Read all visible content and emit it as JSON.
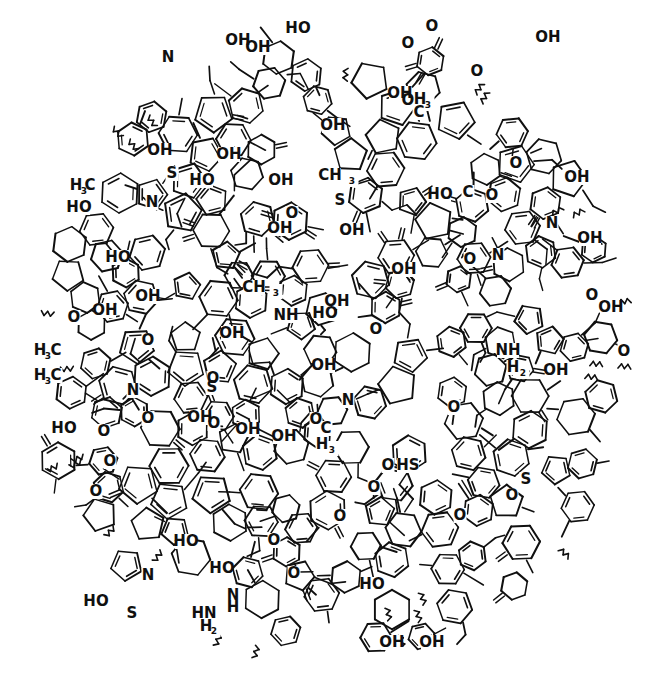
{
  "figure": {
    "kind": "chemical-structure-diagram",
    "background_color": "#ffffff",
    "ink_color": "#101010",
    "width": 661,
    "height": 675,
    "line_style": "black skeletal bond lines, variable weight, scanned print",
    "top_edge_artifact": "partial cropped ink marks from the line of text above the figure"
  },
  "chart_data": {
    "type": "diagram",
    "xlabel": "",
    "ylabel": "",
    "ring_systems": [
      "benzene",
      "naphthalene",
      "anthracene",
      "phenanthrene",
      "fluorene",
      "indane",
      "cyclopentane",
      "cyclohexane",
      "tetrahydropyran",
      "benzofuran",
      "dibenzofuran",
      "furan",
      "chromene",
      "chroman",
      "thiophene",
      "benzothiophene",
      "dibenzothiophene",
      "pyridine",
      "quinoline",
      "acridine",
      "indole",
      "carbazole",
      "quinone",
      "benzodioxine",
      "xanthene"
    ],
    "functional_groups": [
      "hydroxyl (OH)",
      "phenol (HO)",
      "ether (O)",
      "ketone (=O)",
      "carboxylic acid (HOOC)",
      "thiol (HS)",
      "thioether (S)",
      "amine (NH2)",
      "secondary amine (NH / HN)",
      "ring nitrogen (N)",
      "methyl (CH3 / H3C)"
    ],
    "label_counts": {
      "OH": 34,
      "HO": 14,
      "O": 22,
      "N": 8,
      "NH": 3,
      "NH2": 1,
      "HN": 2,
      "S": 4,
      "HS": 1,
      "CH3": 3,
      "H3C": 5,
      "HOOC": 1
    }
  },
  "labels": [
    {
      "t": "N",
      "x": 168,
      "y": 62
    },
    {
      "t": "OH",
      "x": 238,
      "y": 45
    },
    {
      "t": "OH",
      "x": 258,
      "y": 52
    },
    {
      "t": "HO",
      "x": 298,
      "y": 33
    },
    {
      "t": "O",
      "x": 432,
      "y": 31
    },
    {
      "t": "O",
      "x": 408,
      "y": 48
    },
    {
      "t": "O",
      "x": 408,
      "y": 105
    },
    {
      "t": "OH",
      "x": 548,
      "y": 42
    },
    {
      "t": "O",
      "x": 477,
      "y": 76
    },
    {
      "t": "OH",
      "x": 400,
      "y": 98
    },
    {
      "t": "H",
      "x": 420,
      "y": 104
    },
    {
      "t": "3",
      "x": 428,
      "y": 108
    },
    {
      "t": "C",
      "x": 419,
      "y": 117
    },
    {
      "t": "OH",
      "x": 333,
      "y": 130
    },
    {
      "t": "S",
      "x": 172,
      "y": 178
    },
    {
      "t": "H",
      "x": 76,
      "y": 190
    },
    {
      "t": "3",
      "x": 84,
      "y": 194
    },
    {
      "t": "C",
      "x": 90,
      "y": 190
    },
    {
      "t": "HO",
      "x": 79,
      "y": 212
    },
    {
      "t": "N",
      "x": 152,
      "y": 207
    },
    {
      "t": "OH",
      "x": 160,
      "y": 155
    },
    {
      "t": "OH",
      "x": 229,
      "y": 159
    },
    {
      "t": "HO",
      "x": 202,
      "y": 185
    },
    {
      "t": "OH",
      "x": 281,
      "y": 185
    },
    {
      "t": "CH",
      "x": 330,
      "y": 180
    },
    {
      "t": "3",
      "x": 352,
      "y": 184
    },
    {
      "t": "S",
      "x": 340,
      "y": 205
    },
    {
      "t": "O",
      "x": 292,
      "y": 218
    },
    {
      "t": "HO",
      "x": 440,
      "y": 199
    },
    {
      "t": "C",
      "x": 468,
      "y": 197
    },
    {
      "t": "O",
      "x": 492,
      "y": 200
    },
    {
      "t": "OH",
      "x": 577,
      "y": 182
    },
    {
      "t": "O",
      "x": 516,
      "y": 168
    },
    {
      "t": "N",
      "x": 552,
      "y": 228
    },
    {
      "t": "OH",
      "x": 590,
      "y": 243
    },
    {
      "t": "HO",
      "x": 118,
      "y": 262
    },
    {
      "t": "OH",
      "x": 280,
      "y": 233
    },
    {
      "t": "OH",
      "x": 352,
      "y": 235
    },
    {
      "t": "O",
      "x": 470,
      "y": 264
    },
    {
      "t": "N",
      "x": 498,
      "y": 260
    },
    {
      "t": "OH",
      "x": 404,
      "y": 274
    },
    {
      "t": "OH",
      "x": 148,
      "y": 301
    },
    {
      "t": "CH",
      "x": 254,
      "y": 292
    },
    {
      "t": "3",
      "x": 276,
      "y": 296
    },
    {
      "t": "OH",
      "x": 105,
      "y": 315
    },
    {
      "t": "O",
      "x": 74,
      "y": 322
    },
    {
      "t": "O",
      "x": 148,
      "y": 345
    },
    {
      "t": "OH",
      "x": 337,
      "y": 306
    },
    {
      "t": "HO",
      "x": 325,
      "y": 318
    },
    {
      "t": "OH",
      "x": 611,
      "y": 312
    },
    {
      "t": "O",
      "x": 592,
      "y": 300
    },
    {
      "t": "NH",
      "x": 286,
      "y": 320
    },
    {
      "t": "OH",
      "x": 232,
      "y": 338
    },
    {
      "t": "H",
      "x": 40,
      "y": 355
    },
    {
      "t": "3",
      "x": 48,
      "y": 359
    },
    {
      "t": "C",
      "x": 56,
      "y": 355
    },
    {
      "t": "O",
      "x": 376,
      "y": 334
    },
    {
      "t": "OH",
      "x": 324,
      "y": 370
    },
    {
      "t": "NH",
      "x": 508,
      "y": 355
    },
    {
      "t": "H",
      "x": 513,
      "y": 372
    },
    {
      "t": "2",
      "x": 523,
      "y": 376
    },
    {
      "t": "OH",
      "x": 556,
      "y": 375
    },
    {
      "t": "O",
      "x": 624,
      "y": 356
    },
    {
      "t": "H",
      "x": 40,
      "y": 380
    },
    {
      "t": "3",
      "x": 48,
      "y": 384
    },
    {
      "t": "C",
      "x": 56,
      "y": 380
    },
    {
      "t": "N",
      "x": 133,
      "y": 395
    },
    {
      "t": "O",
      "x": 213,
      "y": 383
    },
    {
      "t": "S",
      "x": 212,
      "y": 392
    },
    {
      "t": "HO",
      "x": 64,
      "y": 433
    },
    {
      "t": "O",
      "x": 148,
      "y": 423
    },
    {
      "t": "OH",
      "x": 200,
      "y": 422
    },
    {
      "t": "OH",
      "x": 248,
      "y": 434
    },
    {
      "t": "O",
      "x": 214,
      "y": 428
    },
    {
      "t": "N",
      "x": 348,
      "y": 405
    },
    {
      "t": "O",
      "x": 316,
      "y": 424
    },
    {
      "t": "O",
      "x": 454,
      "y": 412
    },
    {
      "t": "C",
      "x": 326,
      "y": 433
    },
    {
      "t": "H",
      "x": 322,
      "y": 449
    },
    {
      "t": "3",
      "x": 332,
      "y": 453
    },
    {
      "t": "O",
      "x": 104,
      "y": 436
    },
    {
      "t": "OH",
      "x": 284,
      "y": 441
    },
    {
      "t": "O",
      "x": 388,
      "y": 470
    },
    {
      "t": "HS",
      "x": 408,
      "y": 470
    },
    {
      "t": "O",
      "x": 110,
      "y": 466
    },
    {
      "t": "O",
      "x": 96,
      "y": 496
    },
    {
      "t": "O",
      "x": 374,
      "y": 492
    },
    {
      "t": "O",
      "x": 512,
      "y": 500
    },
    {
      "t": "S",
      "x": 526,
      "y": 484
    },
    {
      "t": "HO",
      "x": 186,
      "y": 546
    },
    {
      "t": "O",
      "x": 274,
      "y": 545
    },
    {
      "t": "O",
      "x": 340,
      "y": 521
    },
    {
      "t": "O",
      "x": 460,
      "y": 520
    },
    {
      "t": "HO",
      "x": 222,
      "y": 573
    },
    {
      "t": "O",
      "x": 294,
      "y": 578
    },
    {
      "t": "HO",
      "x": 372,
      "y": 589
    },
    {
      "t": "HO",
      "x": 96,
      "y": 606
    },
    {
      "t": "N",
      "x": 148,
      "y": 580
    },
    {
      "t": "S",
      "x": 132,
      "y": 618
    },
    {
      "t": "N",
      "x": 233,
      "y": 600
    },
    {
      "t": "H",
      "x": 233,
      "y": 612
    },
    {
      "t": "HN",
      "x": 204,
      "y": 618
    },
    {
      "t": "H",
      "x": 206,
      "y": 631
    },
    {
      "t": "2",
      "x": 214,
      "y": 634
    },
    {
      "t": "OH",
      "x": 392,
      "y": 647
    },
    {
      "t": "OH",
      "x": 432,
      "y": 647
    }
  ]
}
